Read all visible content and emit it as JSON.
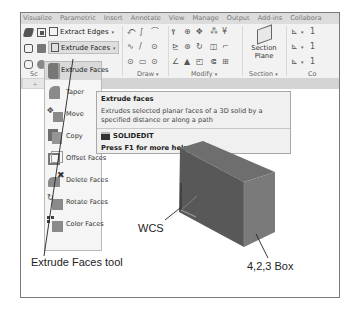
{
  "ribbon": {
    "tabs": [
      "Visualize",
      "Parametric",
      "Insert",
      "Annotate",
      "View",
      "Manage",
      "Output",
      "Add-ins",
      "Collabora"
    ],
    "solid_editing": {
      "extract_edges": "Extract Edges",
      "extrude_faces_split": "Extrude Faces",
      "extrude_faces_active": "Extrude Faces",
      "panel_label": "Sc"
    },
    "panels": {
      "draw": "Draw",
      "modify": "Modify",
      "section": "Section",
      "coordinates": "Co"
    },
    "section_plane": {
      "line1": "Section",
      "line2": "Plane"
    },
    "dropdown_arrow": "▾"
  },
  "flyout_menu": {
    "items": [
      {
        "label": "Taper Faces",
        "visible": "Taper",
        "icon": "taper-faces-icon"
      },
      {
        "label": "Move Faces",
        "visible": "Move",
        "icon": "move-faces-icon"
      },
      {
        "label": "Copy Faces",
        "visible": "Copy",
        "icon": "copy-faces-icon"
      },
      {
        "label": "Offset Faces",
        "visible": "Offset Faces",
        "icon": "offset-faces-icon"
      },
      {
        "label": "Delete Faces",
        "visible": "Delete Faces",
        "icon": "delete-faces-icon"
      },
      {
        "label": "Rotate Faces",
        "visible": "Rotate Faces",
        "icon": "rotate-faces-icon"
      },
      {
        "label": "Color Faces",
        "visible": "Color Faces",
        "icon": "color-faces-icon"
      }
    ]
  },
  "tooltip": {
    "title": "Extrude faces",
    "description": "Extrudes selected planar faces of a 3D solid by a specified distance or along a path",
    "command": "SOLIDEDIT",
    "help": "Press F1 for more help"
  },
  "callouts": {
    "tool": "Extrude Faces tool",
    "wcs": "WCS",
    "box": "4,2,3 Box"
  },
  "colors": {
    "box_front": "#5a5a5a",
    "box_top": "#6e6e6e",
    "box_side": "#7c7c7c",
    "ribbon_bg": "#f2f2f2",
    "tooltip_bg": "#f0f0f0"
  }
}
